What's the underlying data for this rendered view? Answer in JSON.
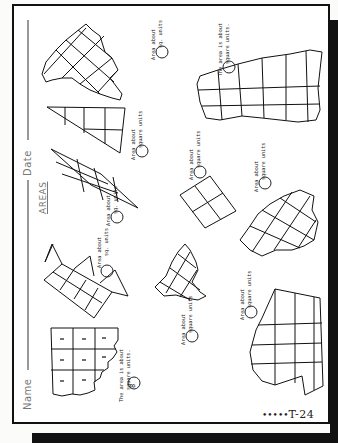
{
  "worksheet": {
    "title": "AREAS",
    "name_label": "Name",
    "date_label": "Date",
    "page_code": "T-24",
    "page_code_dots": "•••••",
    "orientation": "rotated -90deg"
  },
  "problems": [
    {
      "id": 1,
      "shape": "rectangle with ragged edge, 3x3 grid, dashes in cells",
      "line1": "The area is about",
      "line2": "square units.",
      "answer": "8"
    },
    {
      "id": 2,
      "shape": "row of squares with triangles",
      "line1": "Area about",
      "line2": "sq. units",
      "answer": ""
    },
    {
      "id": 3,
      "shape": "ragged diamond-grid blob",
      "line1": "Area about",
      "line2": "square units",
      "answer": ""
    },
    {
      "id": 4,
      "shape": "parallelogram grid",
      "line1": "Area about",
      "line2": "sq. units",
      "answer": ""
    },
    {
      "id": 5,
      "shape": "right triangle grid",
      "line1": "Area about",
      "line2": "square units",
      "answer": ""
    },
    {
      "id": 6,
      "shape": "tilted 2x2 square",
      "line1": "Area about",
      "line2": "square units",
      "answer": ""
    },
    {
      "id": 7,
      "shape": "ragged diagonal grid blob (top)",
      "line1": "Area about",
      "line2": "sq. units",
      "answer": ""
    },
    {
      "id": 8,
      "shape": "ragged diagonal grid blob (middle right)",
      "line1": "Area about",
      "line2": "square units",
      "answer": ""
    },
    {
      "id": 9,
      "shape": "large polygon grid with notch",
      "line1": "Area about",
      "line2": "square units",
      "answer": ""
    },
    {
      "id": 10,
      "shape": "ragged horizontal rectangle grid",
      "line1": "The area is about",
      "line2": "square units.",
      "answer": ""
    }
  ]
}
